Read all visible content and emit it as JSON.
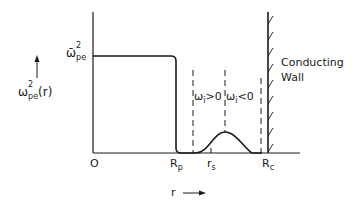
{
  "diagram": {
    "y_axis": {
      "label_symbol": "ω",
      "label_sub": "pe",
      "label_sup": "2",
      "label_arg": "(r)",
      "arrow": "up-arrow"
    },
    "x_axis": {
      "label": "r",
      "arrow": "right-arrow",
      "ticks": [
        {
          "main": "O",
          "sub": ""
        },
        {
          "main": "R",
          "sub": "p"
        },
        {
          "main": "r",
          "sub": "s"
        },
        {
          "main": "R",
          "sub": "c"
        }
      ]
    },
    "plateau_label": {
      "symbol": "ω̄",
      "sub": "pe",
      "sup": "2"
    },
    "regions": [
      {
        "symbol": "ω",
        "sub": "i",
        "relation": ">0"
      },
      {
        "symbol": "ω",
        "sub": "i",
        "relation": "<0"
      }
    ],
    "wall_label_line1": "Conducting",
    "wall_label_line2": "Wall",
    "colors": {
      "ink": "#1a1a1a",
      "background": "#ffffff"
    }
  }
}
